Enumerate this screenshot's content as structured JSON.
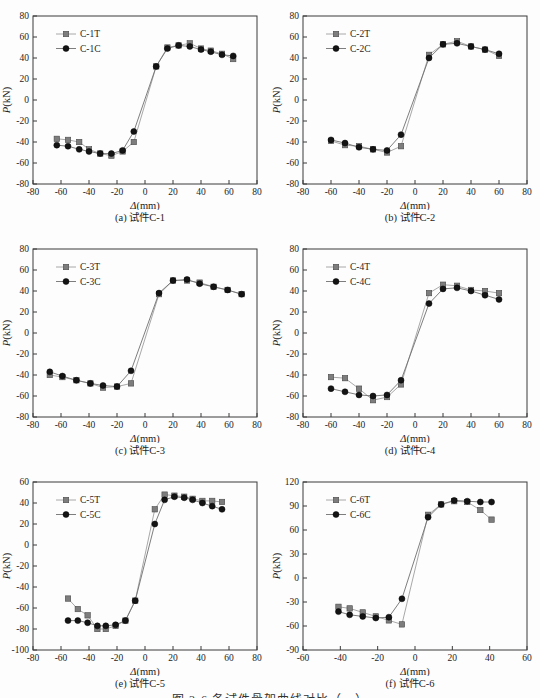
{
  "figure_caption": {
    "text": "图 3-6 各试件骨架曲线对比（一）",
    "note": "partially cut off at bottom edge"
  },
  "palette": {
    "axis": "#3a3a3a",
    "text": "#1e1e1e",
    "t_fill": "#7d7d7d",
    "t_stroke": "#4a4a4a",
    "t_line": "#9e9e9e",
    "c_fill": "#141414",
    "c_stroke": "#000000",
    "c_line": "#6f6f6f"
  },
  "chart_data": [
    {
      "type": "line",
      "panel": "a",
      "caption": "(a) 试件C-1",
      "xlabel": "Δ(mm)",
      "ylabel": "P(kN)",
      "xlim": [
        -80,
        80
      ],
      "xstep": 20,
      "ylim": [
        -80,
        80
      ],
      "ystep": 20,
      "legend_position": "upper-left-inside",
      "series": [
        {
          "name": "C-1T",
          "marker": "square",
          "points": [
            [
              -63,
              -37
            ],
            [
              -55,
              -38
            ],
            [
              -47,
              -40
            ],
            [
              -40,
              -47
            ],
            [
              -32,
              -51
            ],
            [
              -24,
              -53
            ],
            [
              -16,
              -49
            ],
            [
              -8,
              -40
            ],
            [
              8,
              32
            ],
            [
              16,
              50
            ],
            [
              24,
              52
            ],
            [
              32,
              54
            ],
            [
              40,
              49
            ],
            [
              47,
              47
            ],
            [
              55,
              44
            ],
            [
              63,
              39
            ]
          ]
        },
        {
          "name": "C-1C",
          "marker": "circle",
          "points": [
            [
              -63,
              -43
            ],
            [
              -55,
              -44
            ],
            [
              -47,
              -47
            ],
            [
              -40,
              -49
            ],
            [
              -32,
              -51
            ],
            [
              -24,
              -51
            ],
            [
              -16,
              -48
            ],
            [
              -8,
              -30
            ],
            [
              8,
              32
            ],
            [
              16,
              49
            ],
            [
              24,
              52
            ],
            [
              32,
              51
            ],
            [
              40,
              48
            ],
            [
              47,
              46
            ],
            [
              55,
              43
            ],
            [
              63,
              42
            ]
          ]
        }
      ]
    },
    {
      "type": "line",
      "panel": "b",
      "caption": "(b) 试件C-2",
      "xlabel": "Δ(mm)",
      "ylabel": "P(kN)",
      "xlim": [
        -80,
        80
      ],
      "xstep": 20,
      "ylim": [
        -80,
        80
      ],
      "ystep": 20,
      "legend_position": "upper-left-inside",
      "series": [
        {
          "name": "C-2T",
          "marker": "square",
          "points": [
            [
              -60,
              -39
            ],
            [
              -50,
              -43
            ],
            [
              -40,
              -44
            ],
            [
              -30,
              -47
            ],
            [
              -20,
              -50
            ],
            [
              -10,
              -44
            ],
            [
              10,
              43
            ],
            [
              20,
              53
            ],
            [
              30,
              56
            ],
            [
              40,
              51
            ],
            [
              50,
              48
            ],
            [
              60,
              42
            ]
          ]
        },
        {
          "name": "C-2C",
          "marker": "circle",
          "points": [
            [
              -60,
              -38
            ],
            [
              -50,
              -41
            ],
            [
              -40,
              -45
            ],
            [
              -30,
              -47
            ],
            [
              -20,
              -48
            ],
            [
              -10,
              -33
            ],
            [
              10,
              40
            ],
            [
              20,
              53
            ],
            [
              30,
              54
            ],
            [
              40,
              51
            ],
            [
              50,
              48
            ],
            [
              60,
              44
            ]
          ]
        }
      ]
    },
    {
      "type": "line",
      "panel": "c",
      "caption": "(c) 试件C-3",
      "xlabel": "Δ(mm)",
      "ylabel": "P(kN)",
      "xlim": [
        -80,
        80
      ],
      "xstep": 20,
      "ylim": [
        -80,
        80
      ],
      "ystep": 20,
      "legend_position": "upper-left-inside",
      "series": [
        {
          "name": "C-3T",
          "marker": "square",
          "points": [
            [
              -68,
              -40
            ],
            [
              -59,
              -42
            ],
            [
              -49,
              -45
            ],
            [
              -39,
              -48
            ],
            [
              -30,
              -52
            ],
            [
              -20,
              -51
            ],
            [
              -10,
              -48
            ],
            [
              10,
              37
            ],
            [
              20,
              50
            ],
            [
              30,
              50
            ],
            [
              39,
              48
            ],
            [
              49,
              44
            ],
            [
              59,
              41
            ],
            [
              69,
              37
            ]
          ]
        },
        {
          "name": "C-3C",
          "marker": "circle",
          "points": [
            [
              -68,
              -37
            ],
            [
              -59,
              -41
            ],
            [
              -49,
              -45
            ],
            [
              -39,
              -48
            ],
            [
              -30,
              -50
            ],
            [
              -20,
              -51
            ],
            [
              -10,
              -36
            ],
            [
              10,
              38
            ],
            [
              20,
              50
            ],
            [
              30,
              51
            ],
            [
              39,
              47
            ],
            [
              49,
              44
            ],
            [
              59,
              41
            ],
            [
              69,
              37
            ]
          ]
        }
      ]
    },
    {
      "type": "line",
      "panel": "d",
      "caption": "(d) 试件C-4",
      "xlabel": "Δ(mm)",
      "ylabel": "P(kN)",
      "xlim": [
        -80,
        80
      ],
      "xstep": 20,
      "ylim": [
        -80,
        80
      ],
      "ystep": 20,
      "legend_position": "upper-left-inside",
      "series": [
        {
          "name": "C-4T",
          "marker": "square",
          "points": [
            [
              -60,
              -42
            ],
            [
              -50,
              -43
            ],
            [
              -40,
              -53
            ],
            [
              -30,
              -64
            ],
            [
              -20,
              -61
            ],
            [
              -10,
              -49
            ],
            [
              10,
              38
            ],
            [
              20,
              46
            ],
            [
              30,
              45
            ],
            [
              40,
              41
            ],
            [
              50,
              40
            ],
            [
              60,
              38
            ]
          ]
        },
        {
          "name": "C-4C",
          "marker": "circle",
          "points": [
            [
              -60,
              -53
            ],
            [
              -50,
              -56
            ],
            [
              -40,
              -59
            ],
            [
              -30,
              -60
            ],
            [
              -20,
              -59
            ],
            [
              -10,
              -45
            ],
            [
              10,
              28
            ],
            [
              20,
              42
            ],
            [
              30,
              43
            ],
            [
              40,
              40
            ],
            [
              50,
              36
            ],
            [
              60,
              32
            ]
          ]
        }
      ]
    },
    {
      "type": "line",
      "panel": "e",
      "caption": "(e) 试件C-5",
      "xlabel": "Δ(mm)",
      "ylabel": "P(kN)",
      "xlim": [
        -80,
        80
      ],
      "xstep": 20,
      "ylim": [
        -100,
        60
      ],
      "ystep": 20,
      "legend_position": "upper-left-inside",
      "series": [
        {
          "name": "C-5T",
          "marker": "square",
          "points": [
            [
              -55,
              -51
            ],
            [
              -48,
              -61
            ],
            [
              -41,
              -67
            ],
            [
              -34,
              -80
            ],
            [
              -28,
              -80
            ],
            [
              -21,
              -77
            ],
            [
              -14,
              -72
            ],
            [
              -7,
              -53
            ],
            [
              7,
              34
            ],
            [
              14,
              48
            ],
            [
              21,
              47
            ],
            [
              28,
              46
            ],
            [
              34,
              44
            ],
            [
              41,
              42
            ],
            [
              48,
              42
            ],
            [
              55,
              41
            ]
          ]
        },
        {
          "name": "C-5C",
          "marker": "circle",
          "points": [
            [
              -55,
              -72
            ],
            [
              -48,
              -72
            ],
            [
              -41,
              -74
            ],
            [
              -34,
              -77
            ],
            [
              -28,
              -77
            ],
            [
              -21,
              -76
            ],
            [
              -14,
              -72
            ],
            [
              -7,
              -53
            ],
            [
              7,
              20
            ],
            [
              14,
              43
            ],
            [
              21,
              46
            ],
            [
              28,
              45
            ],
            [
              34,
              43
            ],
            [
              41,
              40
            ],
            [
              48,
              37
            ],
            [
              55,
              34
            ]
          ]
        }
      ]
    },
    {
      "type": "line",
      "panel": "f",
      "caption": "(f) 试件C-6",
      "xlabel": "Δ(mm)",
      "ylabel": "P(kN)",
      "xlim": [
        -60,
        60
      ],
      "xstep": 20,
      "ylim": [
        -90,
        120
      ],
      "ystep": 30,
      "legend_position": "upper-left-inside",
      "series": [
        {
          "name": "C-6T",
          "marker": "square",
          "points": [
            [
              -41,
              -36
            ],
            [
              -35,
              -38
            ],
            [
              -28,
              -43
            ],
            [
              -21,
              -48
            ],
            [
              -14,
              -53
            ],
            [
              -7,
              -58
            ],
            [
              7,
              79
            ],
            [
              14,
              92
            ],
            [
              21,
              96
            ],
            [
              28,
              95
            ],
            [
              35,
              85
            ],
            [
              41,
              73
            ]
          ]
        },
        {
          "name": "C-6C",
          "marker": "circle",
          "points": [
            [
              -41,
              -42
            ],
            [
              -35,
              -46
            ],
            [
              -28,
              -48
            ],
            [
              -21,
              -50
            ],
            [
              -14,
              -49
            ],
            [
              -7,
              -26
            ],
            [
              7,
              76
            ],
            [
              14,
              92
            ],
            [
              21,
              97
            ],
            [
              28,
              96
            ],
            [
              35,
              95
            ],
            [
              41,
              95
            ]
          ]
        }
      ]
    }
  ]
}
